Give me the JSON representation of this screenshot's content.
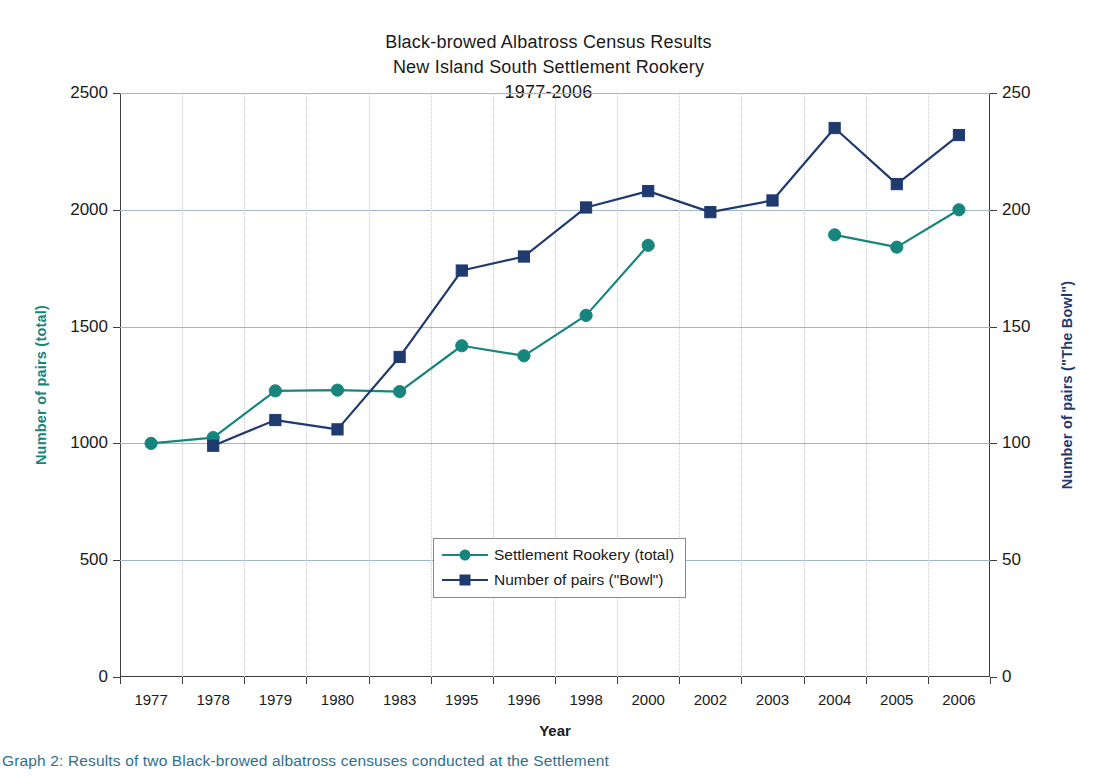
{
  "chart_data": {
    "type": "line",
    "title": "Black-browed Albatross Census Results",
    "subtitle": "New Island South Settlement Rookery",
    "subtitle2": "1977-2006",
    "title_lines": [
      "Black-browed Albatross Census Results",
      "New Island South Settlement Rookery",
      "1977-2006"
    ],
    "xlabel": "Year",
    "ylabel": "Number of pairs (total)",
    "ylabel_secondary": "Number of pairs (\"The Bowl\")",
    "categories": [
      "1977",
      "1978",
      "1979",
      "1980",
      "1983",
      "1995",
      "1996",
      "1998",
      "2000",
      "2002",
      "2003",
      "2004",
      "2005",
      "2006"
    ],
    "ylim": [
      0,
      2500
    ],
    "yticks": [
      0,
      500,
      1000,
      1500,
      2000,
      2500
    ],
    "ylim_secondary": [
      0,
      250
    ],
    "yticks_secondary": [
      0,
      50,
      100,
      150,
      200,
      250
    ],
    "grid": "horizontal-gridlines-and-vertical-dotted",
    "legend_position": "inside-center-lower",
    "series": [
      {
        "name": "Settlement Rookery (total)",
        "axis": "left",
        "color": "#16857e",
        "marker": "circle",
        "values": [
          1000,
          1025,
          1225,
          1228,
          1222,
          1418,
          1375,
          1548,
          1848,
          null,
          null,
          1893,
          1840,
          2000
        ]
      },
      {
        "name": "Number of pairs (\"Bowl\")",
        "axis": "right",
        "color": "#1f3a6e",
        "marker": "square",
        "values": [
          null,
          99,
          110,
          106,
          137,
          174,
          180,
          201,
          208,
          199,
          204,
          235,
          211,
          232
        ]
      }
    ],
    "legend": [
      {
        "label": "Settlement Rookery (total)",
        "color": "#16857e",
        "marker": "circle"
      },
      {
        "label": "Number of pairs (\"Bowl\")",
        "color": "#1f3a6e",
        "marker": "square"
      }
    ]
  },
  "footer": {
    "caption": "Graph 2: Results of two Black-browed albatross censuses conducted at the Settlement"
  },
  "colors": {
    "total_series": "#16857e",
    "bowl_series": "#1f3a6e",
    "gridline": "#9fb7cc",
    "axis": "#3d3d3d",
    "text": "#1a1a1a",
    "caption": "#2f6f8f"
  }
}
